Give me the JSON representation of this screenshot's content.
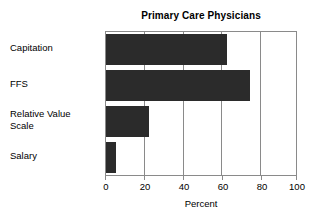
{
  "chart_data": {
    "type": "bar",
    "orientation": "horizontal",
    "title": "Primary Care Physicians",
    "xlabel": "Percent",
    "ylabel": "",
    "categories": [
      "Capitation",
      "FFS",
      "Relative Value Scale",
      "Salary"
    ],
    "values": [
      63,
      75,
      22.5,
      5
    ],
    "xlim": [
      0,
      100
    ],
    "xticks": [
      0,
      20,
      40,
      60,
      80,
      100
    ],
    "xtick_labels": [
      "0",
      "20",
      "40",
      "60",
      "80",
      "100"
    ],
    "grid": true,
    "grid_axis": "x",
    "legend": false,
    "bar_color": "#2b2b2b",
    "frame_color": "#8a8a8a",
    "background": "#ffffff"
  },
  "labels": {
    "capitation": "Capitation",
    "ffs": "FFS",
    "relative_value_line1": "Relative Value",
    "relative_value_line2": "Scale",
    "salary": "Salary"
  }
}
